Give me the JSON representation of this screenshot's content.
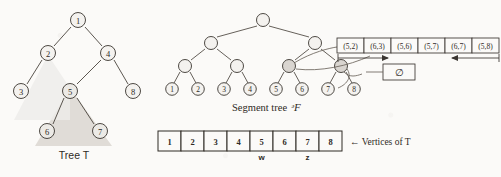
{
  "figure": {
    "caption_left": "Tree T",
    "caption_middle": "Segment tree",
    "caption_middle_symbol": "ᵊF",
    "vertices_label": "← Vertices of T",
    "empty_symbol": "∅"
  },
  "tree_T": {
    "nodes": [
      {
        "id": "1",
        "label": "1",
        "x": 78,
        "y": 20
      },
      {
        "id": "2",
        "label": "2",
        "x": 48,
        "y": 53
      },
      {
        "id": "4",
        "label": "4",
        "x": 108,
        "y": 53
      },
      {
        "id": "3",
        "label": "3",
        "x": 21,
        "y": 91
      },
      {
        "id": "5",
        "label": "5",
        "x": 70,
        "y": 91
      },
      {
        "id": "8",
        "label": "8",
        "x": 133,
        "y": 91
      },
      {
        "id": "6",
        "label": "6",
        "x": 47,
        "y": 131
      },
      {
        "id": "7",
        "label": "7",
        "x": 100,
        "y": 131
      }
    ],
    "edges": [
      {
        "from": "1",
        "to": "2"
      },
      {
        "from": "1",
        "to": "4"
      },
      {
        "from": "2",
        "to": "3"
      },
      {
        "from": "4",
        "to": "5"
      },
      {
        "from": "4",
        "to": "8"
      },
      {
        "from": "5",
        "to": "6"
      },
      {
        "from": "5",
        "to": "7"
      }
    ],
    "highlighted_subtree_root": "5",
    "highlight_color": "#ddd9d4"
  },
  "segment_tree": {
    "leaves": [
      {
        "label": "1",
        "x": 172,
        "y": 89
      },
      {
        "label": "2",
        "x": 198,
        "y": 89
      },
      {
        "label": "3",
        "x": 224,
        "y": 89
      },
      {
        "label": "4",
        "x": 250,
        "y": 89
      },
      {
        "label": "5",
        "x": 276,
        "y": 89
      },
      {
        "label": "6",
        "x": 302,
        "y": 89
      },
      {
        "label": "7",
        "x": 328,
        "y": 89
      },
      {
        "label": "8",
        "x": 354,
        "y": 89
      }
    ],
    "internal_level3": [
      {
        "x": 185,
        "y": 66
      },
      {
        "x": 237,
        "y": 66
      },
      {
        "x": 289,
        "y": 66
      },
      {
        "x": 341,
        "y": 66
      }
    ],
    "internal_level2": [
      {
        "x": 211,
        "y": 43
      },
      {
        "x": 315,
        "y": 43
      }
    ],
    "root": {
      "x": 263,
      "y": 20
    },
    "marked_nodes": [
      {
        "x": 289,
        "y": 66
      },
      {
        "x": 341,
        "y": 66
      }
    ]
  },
  "pair_boxes": {
    "items": [
      {
        "label": "(5,2)"
      },
      {
        "label": "(6,3)"
      },
      {
        "label": "(5,6)"
      },
      {
        "label": "(5,7)"
      },
      {
        "label": "(6,7)"
      },
      {
        "label": "(5,8)"
      }
    ],
    "x": 337,
    "y": 38,
    "cell_width": 27,
    "cell_height": 15
  },
  "vertices_array": {
    "cells": [
      "1",
      "2",
      "3",
      "4",
      "5",
      "6",
      "7",
      "8"
    ],
    "markers": [
      {
        "label": "w",
        "cell_index": 4
      },
      {
        "label": "z",
        "cell_index": 6
      }
    ],
    "x": 158,
    "y": 131,
    "cell_width": 23,
    "cell_height": 20
  },
  "colors": {
    "ink": "#3a3530",
    "paper": "#fbfaf8",
    "node_fill": "#f2f0ed",
    "marked_fill": "#d9d5d0",
    "highlight": "#dedad5"
  }
}
